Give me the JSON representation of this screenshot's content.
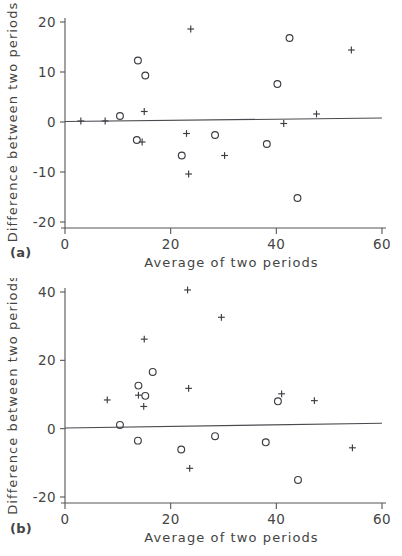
{
  "figure": {
    "panels": [
      {
        "panel_label": "(a)",
        "xlabel": "Average of two periods",
        "ylabel": "Difference between two periods",
        "xticks": [
          "0",
          "20",
          "40",
          "60"
        ],
        "yticks": [
          "20",
          "10",
          "0",
          "-10",
          "-20"
        ]
      },
      {
        "panel_label": "(b)",
        "xlabel": "Average of two periods",
        "ylabel": "Difference between two periods",
        "xticks": [
          "0",
          "20",
          "40",
          "60"
        ],
        "yticks": [
          "40",
          "20",
          "0",
          "-20"
        ]
      }
    ]
  },
  "chart_data": [
    {
      "type": "scatter",
      "panel": "(a)",
      "title": "",
      "xlabel": "Average of two periods",
      "ylabel": "Difference between two periods",
      "xlim": [
        0,
        60
      ],
      "ylim": [
        -20,
        20
      ],
      "xticks": [
        0,
        20,
        40,
        60
      ],
      "yticks": [
        -20,
        -10,
        0,
        10,
        20
      ],
      "grid": false,
      "legend": "none",
      "reference_line": {
        "description": "near-zero fitted mean difference line",
        "x_start": 0,
        "y_start": 0.1,
        "x_end": 60,
        "y_end": 0.8
      },
      "series": [
        {
          "name": "circle-marker",
          "marker": "o",
          "points": [
            {
              "x": 10.4,
              "y": 1.2
            },
            {
              "x": 13.8,
              "y": 12.3
            },
            {
              "x": 15.2,
              "y": 9.3
            },
            {
              "x": 13.6,
              "y": -3.6
            },
            {
              "x": 22.1,
              "y": -6.7
            },
            {
              "x": 28.4,
              "y": -2.6
            },
            {
              "x": 38.2,
              "y": -4.4
            },
            {
              "x": 40.2,
              "y": 7.6
            },
            {
              "x": 42.5,
              "y": 16.8
            },
            {
              "x": 44.0,
              "y": -15.2
            }
          ]
        },
        {
          "name": "plus-marker",
          "marker": "+",
          "points": [
            {
              "x": 3.0,
              "y": 0.2
            },
            {
              "x": 7.6,
              "y": 0.2
            },
            {
              "x": 15.0,
              "y": 2.1
            },
            {
              "x": 14.6,
              "y": -4.0
            },
            {
              "x": 23.0,
              "y": -2.3
            },
            {
              "x": 23.8,
              "y": 18.6
            },
            {
              "x": 23.4,
              "y": -10.4
            },
            {
              "x": 30.2,
              "y": -6.7
            },
            {
              "x": 41.4,
              "y": -0.3
            },
            {
              "x": 47.6,
              "y": 1.6
            },
            {
              "x": 54.2,
              "y": 14.4
            }
          ]
        }
      ]
    },
    {
      "type": "scatter",
      "panel": "(b)",
      "title": "",
      "xlabel": "Average of two periods",
      "ylabel": "Difference between two periods",
      "xlim": [
        0,
        60
      ],
      "ylim": [
        -20,
        40
      ],
      "xticks": [
        0,
        20,
        40,
        60
      ],
      "yticks": [
        -20,
        0,
        20,
        40
      ],
      "grid": false,
      "legend": "none",
      "reference_line": {
        "description": "near-zero fitted mean difference line",
        "x_start": 0,
        "y_start": 0.2,
        "x_end": 60,
        "y_end": 1.6
      },
      "series": [
        {
          "name": "circle-marker",
          "marker": "o",
          "points": [
            {
              "x": 10.4,
              "y": 1.1
            },
            {
              "x": 13.9,
              "y": 12.6
            },
            {
              "x": 15.2,
              "y": 9.6
            },
            {
              "x": 16.6,
              "y": 16.6
            },
            {
              "x": 13.8,
              "y": -3.5
            },
            {
              "x": 22.0,
              "y": -6.1
            },
            {
              "x": 28.4,
              "y": -2.2
            },
            {
              "x": 38.0,
              "y": -4.0
            },
            {
              "x": 40.3,
              "y": 8.0
            },
            {
              "x": 44.1,
              "y": -15.0
            }
          ]
        },
        {
          "name": "plus-marker",
          "marker": "+",
          "points": [
            {
              "x": 8.0,
              "y": 8.4
            },
            {
              "x": 13.9,
              "y": 9.8
            },
            {
              "x": 14.9,
              "y": 6.5
            },
            {
              "x": 15.0,
              "y": 26.2
            },
            {
              "x": 23.2,
              "y": 40.6
            },
            {
              "x": 23.4,
              "y": 11.8
            },
            {
              "x": 23.6,
              "y": -11.6
            },
            {
              "x": 29.6,
              "y": 32.6
            },
            {
              "x": 41.0,
              "y": 10.2
            },
            {
              "x": 47.2,
              "y": 8.2
            },
            {
              "x": 54.4,
              "y": -5.6
            }
          ]
        }
      ]
    }
  ]
}
